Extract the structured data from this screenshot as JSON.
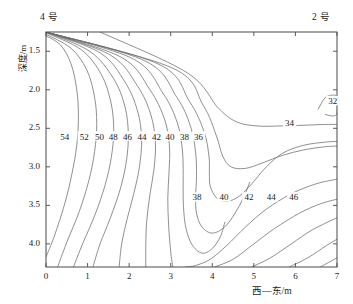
{
  "figure": {
    "top_left_label": "4 号",
    "top_right_label": "2 号",
    "y_axis_title": "深度/m",
    "x_axis_title": "西—东/m"
  },
  "chart_data": {
    "type": "line",
    "subtype": "contour",
    "title": "",
    "xlabel": "西—东/m",
    "ylabel": "深度/m",
    "xlim": [
      0,
      7
    ],
    "ylim": [
      4.3,
      1.25
    ],
    "y_inverted": true,
    "grid": false,
    "legend": false,
    "xticks": [
      0,
      1,
      2,
      3,
      4,
      5,
      6,
      7
    ],
    "xtick_labels": [
      "0",
      "1",
      "2",
      "3",
      "4",
      "5",
      "6",
      "7"
    ],
    "yticks": [
      1.5,
      2.0,
      2.5,
      3.0,
      3.5,
      4.0
    ],
    "ytick_labels": [
      "1.5",
      "2.0",
      "2.5",
      "3.0",
      "3.5",
      "4.0"
    ],
    "contour_interval": 2,
    "contour_levels": [
      32,
      34,
      36,
      38,
      40,
      42,
      44,
      46,
      48,
      50,
      52,
      54,
      56,
      58
    ],
    "labeled_levels_left_row": [
      54,
      52,
      50,
      48,
      46,
      44,
      42,
      40,
      38,
      36
    ],
    "labeled_levels_bottom_row": [
      38,
      40,
      42,
      44,
      46
    ],
    "labeled_levels_right": [
      32,
      34
    ],
    "annotations": [
      {
        "text": "54",
        "x": 0.45,
        "y": 2.63
      },
      {
        "text": "52",
        "x": 0.92,
        "y": 2.63
      },
      {
        "text": "50",
        "x": 1.29,
        "y": 2.63
      },
      {
        "text": "48",
        "x": 1.62,
        "y": 2.63
      },
      {
        "text": "46",
        "x": 1.96,
        "y": 2.63
      },
      {
        "text": "44",
        "x": 2.31,
        "y": 2.63
      },
      {
        "text": "42",
        "x": 2.66,
        "y": 2.63
      },
      {
        "text": "40",
        "x": 2.98,
        "y": 2.63
      },
      {
        "text": "38",
        "x": 3.33,
        "y": 2.63
      },
      {
        "text": "36",
        "x": 3.67,
        "y": 2.63
      },
      {
        "text": "34",
        "x": 5.86,
        "y": 2.46
      },
      {
        "text": "32",
        "x": 6.9,
        "y": 2.17
      },
      {
        "text": "38",
        "x": 3.63,
        "y": 3.42
      },
      {
        "text": "40",
        "x": 4.28,
        "y": 3.42
      },
      {
        "text": "42",
        "x": 4.88,
        "y": 3.42
      },
      {
        "text": "44",
        "x": 5.42,
        "y": 3.42
      },
      {
        "text": "46",
        "x": 5.96,
        "y": 3.42
      }
    ],
    "series": [
      {
        "name": "56",
        "points": [
          [
            0.0,
            1.3
          ],
          [
            0.35,
            1.42
          ],
          [
            0.6,
            1.66
          ],
          [
            0.74,
            2.0
          ],
          [
            0.78,
            2.35
          ],
          [
            0.74,
            2.72
          ],
          [
            0.62,
            3.1
          ],
          [
            0.45,
            3.48
          ],
          [
            0.2,
            3.9
          ],
          [
            0.0,
            4.17
          ]
        ]
      },
      {
        "name": "54",
        "points": [
          [
            0.0,
            1.28
          ],
          [
            0.6,
            1.46
          ],
          [
            0.98,
            1.74
          ],
          [
            1.17,
            2.1
          ],
          [
            1.22,
            2.45
          ],
          [
            1.17,
            2.8
          ],
          [
            1.03,
            3.18
          ],
          [
            0.8,
            3.58
          ],
          [
            0.5,
            3.98
          ],
          [
            0.28,
            4.3
          ]
        ]
      },
      {
        "name": "52",
        "points": [
          [
            0.0,
            1.26
          ],
          [
            0.85,
            1.48
          ],
          [
            1.33,
            1.8
          ],
          [
            1.56,
            2.16
          ],
          [
            1.63,
            2.52
          ],
          [
            1.57,
            2.88
          ],
          [
            1.42,
            3.24
          ],
          [
            1.18,
            3.62
          ],
          [
            0.88,
            4.0
          ],
          [
            0.66,
            4.3
          ]
        ]
      },
      {
        "name": "50",
        "points": [
          [
            0.0,
            1.25
          ],
          [
            1.05,
            1.5
          ],
          [
            1.62,
            1.85
          ],
          [
            1.9,
            2.22
          ],
          [
            1.98,
            2.58
          ],
          [
            1.93,
            2.94
          ],
          [
            1.78,
            3.3
          ],
          [
            1.55,
            3.66
          ],
          [
            1.3,
            4.0
          ],
          [
            1.13,
            4.3
          ]
        ]
      },
      {
        "name": "48",
        "points": [
          [
            0.0,
            1.25
          ],
          [
            1.3,
            1.52
          ],
          [
            1.9,
            1.9
          ],
          [
            2.2,
            2.27
          ],
          [
            2.3,
            2.63
          ],
          [
            2.25,
            2.99
          ],
          [
            2.12,
            3.33
          ],
          [
            1.95,
            3.68
          ],
          [
            1.82,
            4.0
          ],
          [
            1.76,
            4.3
          ]
        ]
      },
      {
        "name": "46",
        "points": [
          [
            0.0,
            1.25
          ],
          [
            1.55,
            1.55
          ],
          [
            2.2,
            1.95
          ],
          [
            2.52,
            2.32
          ],
          [
            2.63,
            2.68
          ],
          [
            2.6,
            3.02
          ],
          [
            2.5,
            3.36
          ],
          [
            2.42,
            3.72
          ],
          [
            2.4,
            4.05
          ],
          [
            2.4,
            4.3
          ]
        ]
      },
      {
        "name": "44",
        "points": [
          [
            0.0,
            1.25
          ],
          [
            1.82,
            1.58
          ],
          [
            2.5,
            2.0
          ],
          [
            2.85,
            2.38
          ],
          [
            2.97,
            2.73
          ],
          [
            2.96,
            3.06
          ],
          [
            2.93,
            3.4
          ],
          [
            2.95,
            3.76
          ],
          [
            3.0,
            4.1
          ],
          [
            3.05,
            4.3
          ]
        ]
      },
      {
        "name": "42",
        "points": [
          [
            0.0,
            1.25
          ],
          [
            2.1,
            1.6
          ],
          [
            2.82,
            2.05
          ],
          [
            3.16,
            2.43
          ],
          [
            3.28,
            2.78
          ],
          [
            3.3,
            3.1
          ],
          [
            3.3,
            3.42
          ],
          [
            3.35,
            3.75
          ],
          [
            3.5,
            4.0
          ],
          [
            3.75,
            4.12
          ],
          [
            4.0,
            4.06
          ],
          [
            4.2,
            3.9
          ],
          [
            4.3,
            3.72
          ]
        ]
      },
      {
        "name": "40",
        "points": [
          [
            0.0,
            1.25
          ],
          [
            2.4,
            1.63
          ],
          [
            3.15,
            2.1
          ],
          [
            3.48,
            2.48
          ],
          [
            3.6,
            2.82
          ],
          [
            3.62,
            3.12
          ],
          [
            3.6,
            3.38
          ],
          [
            3.62,
            3.6
          ],
          [
            3.75,
            3.78
          ],
          [
            4.0,
            3.86
          ],
          [
            4.3,
            3.78
          ],
          [
            4.55,
            3.6
          ],
          [
            4.75,
            3.4
          ],
          [
            4.9,
            3.2
          ]
        ]
      },
      {
        "name": "38",
        "points": [
          [
            0.0,
            1.25
          ],
          [
            2.72,
            1.67
          ],
          [
            3.45,
            2.15
          ],
          [
            3.8,
            2.54
          ],
          [
            3.92,
            2.86
          ],
          [
            3.93,
            3.08
          ],
          [
            3.95,
            3.25
          ],
          [
            4.1,
            3.4
          ],
          [
            4.35,
            3.45
          ],
          [
            4.65,
            3.38
          ],
          [
            4.95,
            3.22
          ],
          [
            5.3,
            3.0
          ],
          [
            5.7,
            2.82
          ],
          [
            6.2,
            2.72
          ],
          [
            6.7,
            2.68
          ],
          [
            7.0,
            2.67
          ]
        ]
      },
      {
        "name": "36",
        "points": [
          [
            0.0,
            1.25
          ],
          [
            3.05,
            1.72
          ],
          [
            3.78,
            2.2
          ],
          [
            4.1,
            2.6
          ],
          [
            4.25,
            2.86
          ],
          [
            4.45,
            3.0
          ],
          [
            4.8,
            3.02
          ],
          [
            5.2,
            2.95
          ],
          [
            5.7,
            2.85
          ],
          [
            6.2,
            2.78
          ],
          [
            6.7,
            2.74
          ],
          [
            7.0,
            2.73
          ]
        ]
      },
      {
        "name": "34",
        "points": [
          [
            1.3,
            1.25
          ],
          [
            3.4,
            1.78
          ],
          [
            4.15,
            2.24
          ],
          [
            4.6,
            2.42
          ],
          [
            5.1,
            2.47
          ],
          [
            5.6,
            2.47
          ],
          [
            6.2,
            2.46
          ],
          [
            6.7,
            2.45
          ],
          [
            7.0,
            2.45
          ]
        ]
      },
      {
        "name": "32",
        "points": [
          [
            6.55,
            2.25
          ],
          [
            6.72,
            2.1
          ],
          [
            6.95,
            2.07
          ],
          [
            7.0,
            2.12
          ],
          [
            7.0,
            2.3
          ],
          [
            6.9,
            2.34
          ],
          [
            6.72,
            2.32
          ]
        ]
      },
      {
        "name": "42-lower-right",
        "points": [
          [
            3.35,
            4.3
          ],
          [
            3.6,
            4.28
          ],
          [
            3.95,
            4.2
          ],
          [
            4.35,
            4.02
          ],
          [
            4.8,
            3.78
          ],
          [
            5.3,
            3.55
          ],
          [
            5.9,
            3.35
          ],
          [
            6.5,
            3.22
          ],
          [
            7.0,
            3.16
          ]
        ]
      },
      {
        "name": "44-lower-right",
        "points": [
          [
            4.05,
            4.3
          ],
          [
            4.5,
            4.2
          ],
          [
            5.0,
            4.0
          ],
          [
            5.5,
            3.8
          ],
          [
            6.1,
            3.6
          ],
          [
            6.6,
            3.48
          ],
          [
            7.0,
            3.42
          ]
        ]
      },
      {
        "name": "46-lower-right",
        "points": [
          [
            4.95,
            4.3
          ],
          [
            5.4,
            4.18
          ],
          [
            5.9,
            4.0
          ],
          [
            6.4,
            3.82
          ],
          [
            7.0,
            3.66
          ]
        ]
      },
      {
        "name": "48-lower-right",
        "points": [
          [
            5.85,
            4.3
          ],
          [
            6.3,
            4.18
          ],
          [
            6.75,
            4.02
          ],
          [
            7.0,
            3.94
          ]
        ]
      },
      {
        "name": "50-lower-right",
        "points": [
          [
            6.6,
            4.3
          ],
          [
            7.0,
            4.18
          ]
        ]
      }
    ]
  }
}
